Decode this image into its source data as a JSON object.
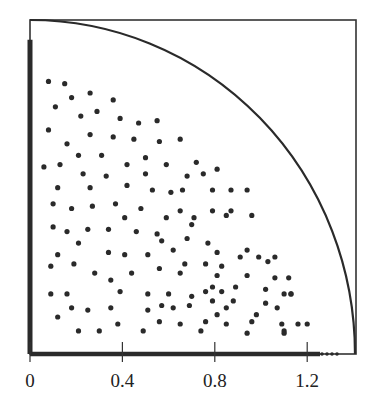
{
  "chart_data": {
    "type": "scatter",
    "title": "",
    "xlabel": "",
    "ylabel": "",
    "xlim": [
      0,
      1.414
    ],
    "ylim": [
      0,
      1.414
    ],
    "grid": false,
    "legend": null,
    "x_ticks": [
      0,
      0.4,
      0.8,
      1.2
    ],
    "x_tick_labels": [
      "0",
      "0.4",
      "0.8",
      "1.2"
    ],
    "curve": {
      "type": "quarter-circle",
      "radius": 1.414,
      "center": [
        0,
        0
      ]
    },
    "axis_point_rows": {
      "left_axis_y_range": [
        0,
        1.36
      ],
      "bottom_axis_x_range": [
        0,
        1.35
      ]
    },
    "series": [
      {
        "name": "interior points",
        "points": [
          [
            0.08,
            1.18
          ],
          [
            0.15,
            1.17
          ],
          [
            0.26,
            1.13
          ],
          [
            0.18,
            1.11
          ],
          [
            0.36,
            1.1
          ],
          [
            0.11,
            1.07
          ],
          [
            0.29,
            1.05
          ],
          [
            0.22,
            1.03
          ],
          [
            0.39,
            1.02
          ],
          [
            0.47,
            1.0
          ],
          [
            0.55,
            1.01
          ],
          [
            0.08,
            0.97
          ],
          [
            0.26,
            0.95
          ],
          [
            0.36,
            0.94
          ],
          [
            0.45,
            0.93
          ],
          [
            0.56,
            0.92
          ],
          [
            0.65,
            0.93
          ],
          [
            0.16,
            0.91
          ],
          [
            0.21,
            0.86
          ],
          [
            0.31,
            0.86
          ],
          [
            0.5,
            0.85
          ],
          [
            0.06,
            0.81
          ],
          [
            0.13,
            0.82
          ],
          [
            0.42,
            0.82
          ],
          [
            0.59,
            0.82
          ],
          [
            0.72,
            0.83
          ],
          [
            0.68,
            0.77
          ],
          [
            0.81,
            0.8
          ],
          [
            0.75,
            0.78
          ],
          [
            0.23,
            0.78
          ],
          [
            0.33,
            0.77
          ],
          [
            0.5,
            0.78
          ],
          [
            0.12,
            0.72
          ],
          [
            0.26,
            0.72
          ],
          [
            0.42,
            0.73
          ],
          [
            0.53,
            0.71
          ],
          [
            0.61,
            0.7
          ],
          [
            0.66,
            0.71
          ],
          [
            0.79,
            0.71
          ],
          [
            0.87,
            0.71
          ],
          [
            0.94,
            0.71
          ],
          [
            0.65,
            0.62
          ],
          [
            0.79,
            0.62
          ],
          [
            0.87,
            0.62
          ],
          [
            0.1,
            0.65
          ],
          [
            0.18,
            0.63
          ],
          [
            0.27,
            0.64
          ],
          [
            0.37,
            0.65
          ],
          [
            0.48,
            0.63
          ],
          [
            0.41,
            0.59
          ],
          [
            0.1,
            0.55
          ],
          [
            0.16,
            0.53
          ],
          [
            0.25,
            0.54
          ],
          [
            0.34,
            0.54
          ],
          [
            0.46,
            0.53
          ],
          [
            0.55,
            0.52
          ],
          [
            0.59,
            0.59
          ],
          [
            0.71,
            0.59
          ],
          [
            0.85,
            0.6
          ],
          [
            0.7,
            0.56
          ],
          [
            0.96,
            0.6
          ],
          [
            0.21,
            0.48
          ],
          [
            0.12,
            0.43
          ],
          [
            0.34,
            0.44
          ],
          [
            0.41,
            0.43
          ],
          [
            0.51,
            0.43
          ],
          [
            0.57,
            0.49
          ],
          [
            0.68,
            0.5
          ],
          [
            0.77,
            0.48
          ],
          [
            0.94,
            0.45
          ],
          [
            0.62,
            0.45
          ],
          [
            0.81,
            0.44
          ],
          [
            0.91,
            0.42
          ],
          [
            0.99,
            0.42
          ],
          [
            1.06,
            0.42
          ],
          [
            0.67,
            0.39
          ],
          [
            0.76,
            0.39
          ],
          [
            0.83,
            0.38
          ],
          [
            1.03,
            0.4
          ],
          [
            1.12,
            0.33
          ],
          [
            0.09,
            0.38
          ],
          [
            0.19,
            0.39
          ],
          [
            0.28,
            0.35
          ],
          [
            0.35,
            0.32
          ],
          [
            0.44,
            0.35
          ],
          [
            0.56,
            0.37
          ],
          [
            0.65,
            0.35
          ],
          [
            0.81,
            0.34
          ],
          [
            0.94,
            0.34
          ],
          [
            1.06,
            0.33
          ],
          [
            0.79,
            0.29
          ],
          [
            0.89,
            0.29
          ],
          [
            0.76,
            0.27
          ],
          [
            0.83,
            0.27
          ],
          [
            1.02,
            0.28
          ],
          [
            1.1,
            0.26
          ],
          [
            1.13,
            0.26
          ],
          [
            0.09,
            0.26
          ],
          [
            0.16,
            0.26
          ],
          [
            0.39,
            0.27
          ],
          [
            0.51,
            0.26
          ],
          [
            0.6,
            0.26
          ],
          [
            0.7,
            0.25
          ],
          [
            0.57,
            0.21
          ],
          [
            0.69,
            0.21
          ],
          [
            0.79,
            0.23
          ],
          [
            0.88,
            0.23
          ],
          [
            1.02,
            0.22
          ],
          [
            1.07,
            0.2
          ],
          [
            0.18,
            0.2
          ],
          [
            0.25,
            0.19
          ],
          [
            0.35,
            0.2
          ],
          [
            0.51,
            0.19
          ],
          [
            0.62,
            0.2
          ],
          [
            0.85,
            0.2
          ],
          [
            1.13,
            0.26
          ],
          [
            0.12,
            0.16
          ],
          [
            0.21,
            0.1
          ],
          [
            0.3,
            0.1
          ],
          [
            0.38,
            0.13
          ],
          [
            0.49,
            0.1
          ],
          [
            0.56,
            0.14
          ],
          [
            0.65,
            0.13
          ],
          [
            0.76,
            0.14
          ],
          [
            0.85,
            0.13
          ],
          [
            0.96,
            0.14
          ],
          [
            1.09,
            0.13
          ],
          [
            1.16,
            0.13
          ],
          [
            0.74,
            0.1
          ],
          [
            0.81,
            0.17
          ],
          [
            0.98,
            0.17
          ],
          [
            0.94,
            0.09
          ],
          [
            1.1,
            0.1
          ],
          [
            1.2,
            0.13
          ],
          [
            1.1,
            0.09
          ]
        ]
      }
    ]
  }
}
